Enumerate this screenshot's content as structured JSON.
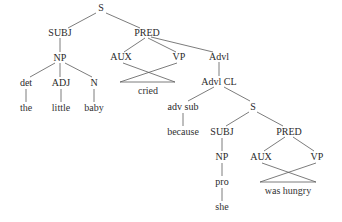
{
  "diagram": {
    "type": "syntax-tree",
    "sentence": "the little baby cried because she was hungry",
    "colors": {
      "text": "#2a2a2a",
      "edge": "#5a5a5a",
      "background": "#ffffff"
    },
    "nodes": {
      "s_root": {
        "label": "S",
        "x": 101,
        "y": 8
      },
      "subj1": {
        "label": "SUBJ",
        "x": 60,
        "y": 33
      },
      "pred1": {
        "label": "PRED",
        "x": 147,
        "y": 33
      },
      "np1": {
        "label": "NP",
        "x": 60,
        "y": 58
      },
      "det": {
        "label": "det",
        "x": 26,
        "y": 83
      },
      "adj": {
        "label": "ADJ",
        "x": 61,
        "y": 83
      },
      "n": {
        "label": "N",
        "x": 94,
        "y": 83
      },
      "the": {
        "label": "the",
        "x": 26,
        "y": 108
      },
      "little": {
        "label": "little",
        "x": 61,
        "y": 108
      },
      "baby": {
        "label": "baby",
        "x": 94,
        "y": 108
      },
      "aux1": {
        "label": "AUX",
        "x": 121,
        "y": 57
      },
      "vp1": {
        "label": "VP",
        "x": 179,
        "y": 57
      },
      "cried": {
        "label": "cried",
        "x": 148,
        "y": 91
      },
      "advl": {
        "label": "Advl",
        "x": 219,
        "y": 57
      },
      "advl_cl": {
        "label": "Advl CL",
        "x": 219,
        "y": 82
      },
      "adv_sub": {
        "label": "adv sub",
        "x": 183,
        "y": 107
      },
      "because": {
        "label": "because",
        "x": 183,
        "y": 132
      },
      "s2": {
        "label": "S",
        "x": 253,
        "y": 107
      },
      "subj2": {
        "label": "SUBJ",
        "x": 222,
        "y": 132
      },
      "np2": {
        "label": "NP",
        "x": 222,
        "y": 157
      },
      "pro": {
        "label": "pro",
        "x": 222,
        "y": 182
      },
      "she": {
        "label": "she",
        "x": 222,
        "y": 207
      },
      "pred2": {
        "label": "PRED",
        "x": 289,
        "y": 132
      },
      "aux2": {
        "label": "AUX",
        "x": 261,
        "y": 157
      },
      "vp2": {
        "label": "VP",
        "x": 317,
        "y": 157
      },
      "was_hungry": {
        "label": "was hungry",
        "x": 288,
        "y": 191
      }
    }
  }
}
